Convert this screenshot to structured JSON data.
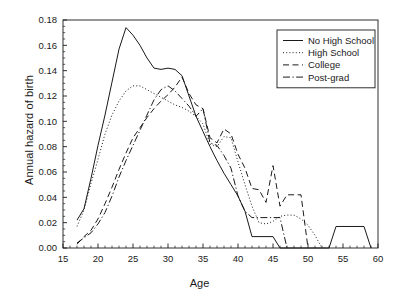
{
  "chart_data": {
    "type": "line",
    "title": "",
    "xlabel": "Age",
    "ylabel": "Annual hazard of birth",
    "xlim": [
      15,
      60
    ],
    "ylim": [
      0.0,
      0.18
    ],
    "xticks": [
      15,
      20,
      25,
      30,
      35,
      40,
      45,
      50,
      55,
      60
    ],
    "xtick_labels": [
      "15",
      "20",
      "25",
      "30",
      "35",
      "40",
      "45",
      "50",
      "55",
      "60"
    ],
    "xminor_step": 1,
    "yticks": [
      0.0,
      0.02,
      0.04,
      0.06,
      0.08,
      0.1,
      0.12,
      0.14,
      0.16,
      0.18
    ],
    "ytick_labels": [
      "0.00",
      "0.02",
      "0.04",
      "0.06",
      "0.08",
      "0.10",
      "0.12",
      "0.14",
      "0.16",
      "0.18"
    ],
    "grid": false,
    "legend_position": "top-right",
    "frame": "box",
    "line_color": "#1a1a1a",
    "series": [
      {
        "name": "No High School",
        "style": "solid",
        "dash": "none",
        "x": [
          17,
          18,
          19,
          20,
          21,
          22,
          23,
          24,
          25,
          26,
          27,
          28,
          29,
          30,
          31,
          32,
          33,
          34,
          35,
          36,
          37,
          38,
          39,
          40,
          41,
          42,
          43,
          44,
          45,
          46,
          47,
          48,
          49,
          50,
          51,
          52,
          53,
          54,
          55,
          56,
          57,
          58,
          59
        ],
        "values": [
          0.022,
          0.031,
          0.055,
          0.081,
          0.105,
          0.131,
          0.157,
          0.174,
          0.168,
          0.16,
          0.15,
          0.142,
          0.141,
          0.142,
          0.141,
          0.136,
          0.12,
          0.104,
          0.092,
          0.08,
          0.069,
          0.059,
          0.05,
          0.041,
          0.029,
          0.009,
          0.009,
          0.009,
          0.009,
          0.0,
          0.0,
          0.0,
          0.0,
          0.0,
          0.0,
          0.0,
          0.0,
          0.017,
          0.017,
          0.017,
          0.017,
          0.017,
          0.0
        ]
      },
      {
        "name": "High School",
        "style": "dotted",
        "dash": "1,2.2",
        "x": [
          17,
          18,
          19,
          20,
          21,
          22,
          23,
          24,
          25,
          26,
          27,
          28,
          29,
          30,
          31,
          32,
          33,
          34,
          35,
          36,
          37,
          38,
          39,
          40,
          41,
          42,
          43,
          44,
          45,
          46,
          47,
          48,
          49,
          50,
          51,
          52
        ],
        "values": [
          0.017,
          0.03,
          0.051,
          0.07,
          0.09,
          0.105,
          0.116,
          0.124,
          0.128,
          0.128,
          0.125,
          0.122,
          0.119,
          0.116,
          0.113,
          0.111,
          0.108,
          0.104,
          0.098,
          0.082,
          0.08,
          0.088,
          0.087,
          0.068,
          0.05,
          0.033,
          0.02,
          0.019,
          0.021,
          0.025,
          0.026,
          0.026,
          0.023,
          0.018,
          0.01,
          0.0
        ]
      },
      {
        "name": "College",
        "style": "dashed",
        "dash": "6,3.5",
        "x": [
          17,
          18,
          19,
          20,
          21,
          22,
          23,
          24,
          25,
          26,
          27,
          28,
          29,
          30,
          31,
          32,
          33,
          34,
          35,
          36,
          37,
          38,
          39,
          40,
          41,
          42,
          43,
          44,
          45,
          46,
          47,
          48,
          49,
          50
        ],
        "values": [
          0.003,
          0.009,
          0.014,
          0.023,
          0.035,
          0.048,
          0.062,
          0.075,
          0.087,
          0.095,
          0.103,
          0.11,
          0.116,
          0.121,
          0.127,
          0.135,
          0.122,
          0.113,
          0.11,
          0.087,
          0.083,
          0.094,
          0.09,
          0.074,
          0.063,
          0.047,
          0.046,
          0.036,
          0.065,
          0.033,
          0.042,
          0.042,
          0.042,
          0.0
        ]
      },
      {
        "name": "Post-grad",
        "style": "dash-dot",
        "dash": "7,2.5,1.2,2.5",
        "x": [
          17,
          18,
          19,
          20,
          21,
          22,
          23,
          24,
          25,
          26,
          27,
          28,
          29,
          30,
          31,
          32,
          33,
          34,
          35,
          36,
          37,
          38,
          39,
          40,
          41,
          42,
          43,
          44,
          45,
          46,
          47
        ],
        "values": [
          0.004,
          0.008,
          0.012,
          0.019,
          0.028,
          0.041,
          0.056,
          0.069,
          0.081,
          0.093,
          0.105,
          0.117,
          0.125,
          0.128,
          0.124,
          0.118,
          0.112,
          0.104,
          0.11,
          0.083,
          0.081,
          0.073,
          0.063,
          0.041,
          0.029,
          0.024,
          0.024,
          0.024,
          0.024,
          0.024,
          0.0
        ]
      }
    ]
  },
  "legend": {
    "entries": [
      {
        "label": "No High School"
      },
      {
        "label": "High School"
      },
      {
        "label": "College"
      },
      {
        "label": "Post-grad"
      }
    ]
  },
  "axis_titles": {
    "x": "Age",
    "y": "Annual hazard of birth"
  }
}
